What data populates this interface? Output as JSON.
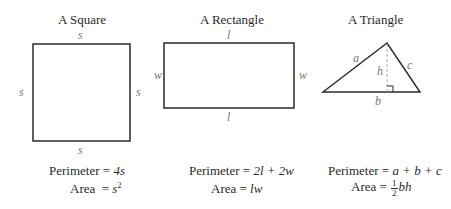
{
  "shapes": {
    "square": {
      "title": "A Square",
      "side_label": "s",
      "perimeter_label": "Perimeter = ",
      "perimeter_expr": "4s",
      "area_label": "Area  = ",
      "area_base": "s",
      "area_exp": "2"
    },
    "rectangle": {
      "title": "A Rectangle",
      "length_label": "l",
      "width_label": "w",
      "perimeter_label": "Perimeter = ",
      "perimeter_expr": "2l + 2w",
      "area_label": "Area = ",
      "area_expr": "lw"
    },
    "triangle": {
      "title": "A Triangle",
      "side_a": "a",
      "side_b": "b",
      "side_c": "c",
      "height": "h",
      "perimeter_label": "Perimeter = ",
      "perimeter_expr": "a + b + c",
      "area_label": "Area = ",
      "area_frac_num": "1",
      "area_frac_den": "2",
      "area_expr": "bh"
    }
  },
  "colors": {
    "stroke": "#2a2a2a",
    "label": "#777777",
    "dashed": "#aaaaaa"
  }
}
